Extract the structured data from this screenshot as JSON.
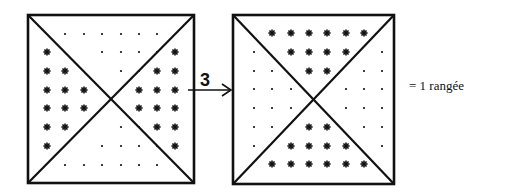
{
  "diagram": {
    "arrow_label": "3",
    "legend_text": "= 1 rangée",
    "colors": {
      "ink": "#111111",
      "background": "#ffffff"
    },
    "left_square": {
      "description": "Square divided by diagonals; stars in left and right triangles, dots in top and bottom triangles",
      "top_triangle_dots_rows": [
        6,
        4,
        2
      ],
      "bottom_triangle_dots_rows": [
        2,
        4,
        6
      ],
      "left_triangle_star_columns": [
        6,
        4,
        2
      ],
      "right_triangle_star_columns": [
        6,
        4,
        2
      ]
    },
    "right_square": {
      "description": "Square divided by diagonals; stars in top and bottom triangles, dots in left and right triangles",
      "top_triangle_star_rows": [
        6,
        4,
        2
      ],
      "bottom_triangle_star_rows": [
        2,
        4,
        6
      ],
      "left_triangle_dot_columns": [
        6,
        4,
        2
      ],
      "right_triangle_dot_columns": [
        6,
        4,
        2
      ]
    }
  }
}
